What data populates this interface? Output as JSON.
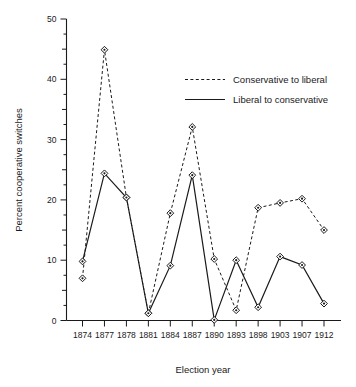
{
  "chart_data": {
    "type": "line",
    "title": "",
    "xlabel": "Election year",
    "ylabel": "Percent cooperative switches",
    "categories": [
      "1874",
      "1877",
      "1878",
      "1881",
      "1884",
      "1887",
      "1890",
      "1893",
      "1898",
      "1903",
      "1907",
      "1912"
    ],
    "ylim": [
      0,
      50
    ],
    "yticks": [
      0,
      10,
      20,
      30,
      40,
      50
    ],
    "yticklabels": [
      "0",
      "10",
      "20",
      "30",
      "40",
      "50"
    ],
    "minor_tick_step": 2.5,
    "grid": false,
    "legend_position": "upper right",
    "series": [
      {
        "name": "Conservative to liberal",
        "style": "dashed",
        "marker": "diamond",
        "values": [
          7.0,
          44.9,
          20.4,
          1.2,
          17.8,
          32.1,
          10.2,
          1.7,
          18.7,
          19.5,
          20.2,
          15.0
        ]
      },
      {
        "name": "Liberal to conservative",
        "style": "solid",
        "marker": "diamond",
        "values": [
          9.8,
          24.4,
          20.4,
          1.2,
          9.1,
          24.1,
          0.1,
          10.0,
          2.2,
          10.6,
          9.2,
          2.8
        ]
      }
    ]
  },
  "legend": {
    "items": [
      {
        "label": "Conservative to liberal",
        "style": "dashed"
      },
      {
        "label": "Liberal to conservative",
        "style": "solid"
      }
    ]
  },
  "colors": {
    "ink": "#1a1a1a",
    "background": "#ffffff",
    "marker_fill": "#ffffff"
  }
}
